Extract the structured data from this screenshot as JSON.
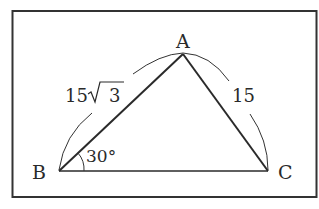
{
  "diagram": {
    "type": "triangle",
    "vertices": {
      "A": {
        "label": "A",
        "x": 183,
        "y": 54
      },
      "B": {
        "label": "B",
        "x": 59,
        "y": 171
      },
      "C": {
        "label": "C",
        "x": 268,
        "y": 171
      }
    },
    "sides": {
      "AB": {
        "label_num": "15",
        "label_root": "3",
        "label": "15√3"
      },
      "AC": {
        "label": "15"
      }
    },
    "angles": {
      "B": {
        "label": "30°"
      }
    }
  },
  "colors": {
    "line": "#2a2a2a",
    "frame": "#333333",
    "background": "#ffffff"
  }
}
